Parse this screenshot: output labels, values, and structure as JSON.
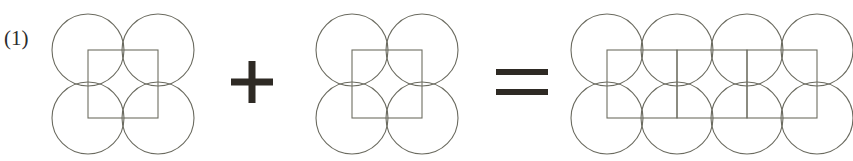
{
  "figure": {
    "label": "(1)",
    "label_position": {
      "x": 4,
      "y": 45
    },
    "colors": {
      "background": "#ffffff",
      "circle_stroke": "#6b6b60",
      "square_stroke": "#6e6e62",
      "operator": "#2e2a24",
      "label_text": "#2b2b2b"
    },
    "stroke_widths": {
      "circle": 1.1,
      "square": 1.1
    },
    "circle_radius": 36,
    "terms": [
      {
        "name": "left-term",
        "kind": "circle-square-tile",
        "circle_centers": [
          {
            "cx": 88,
            "cy": 50
          },
          {
            "cx": 158,
            "cy": 50
          },
          {
            "cx": 88,
            "cy": 118
          },
          {
            "cx": 158,
            "cy": 118
          }
        ],
        "rects": [
          {
            "x": 88,
            "y": 50,
            "w": 70,
            "h": 68
          }
        ],
        "circle_count": 4,
        "square_count": 1
      },
      {
        "name": "middle-term",
        "kind": "circle-square-tile",
        "circle_centers": [
          {
            "cx": 352,
            "cy": 50
          },
          {
            "cx": 422,
            "cy": 50
          },
          {
            "cx": 352,
            "cy": 118
          },
          {
            "cx": 422,
            "cy": 118
          }
        ],
        "rects": [
          {
            "x": 352,
            "y": 50,
            "w": 70,
            "h": 68
          }
        ],
        "circle_count": 4,
        "square_count": 1
      },
      {
        "name": "result-term",
        "kind": "circle-square-tile",
        "circle_centers": [
          {
            "cx": 607,
            "cy": 50
          },
          {
            "cx": 677,
            "cy": 50
          },
          {
            "cx": 747,
            "cy": 50
          },
          {
            "cx": 817,
            "cy": 50
          },
          {
            "cx": 607,
            "cy": 118
          },
          {
            "cx": 677,
            "cy": 118
          },
          {
            "cx": 747,
            "cy": 118
          },
          {
            "cx": 817,
            "cy": 118
          }
        ],
        "rects": [
          {
            "x": 607,
            "y": 50,
            "w": 70,
            "h": 68
          },
          {
            "x": 677,
            "y": 50,
            "w": 70,
            "h": 68
          },
          {
            "x": 747,
            "y": 50,
            "w": 70,
            "h": 68
          }
        ],
        "circle_count": 8,
        "square_count": 3
      }
    ],
    "operators": [
      {
        "name": "plus-operator",
        "glyph": "+",
        "cx": 252,
        "cy": 82,
        "arm": 21,
        "thickness": 7
      },
      {
        "name": "equals-operator",
        "glyph": "=",
        "cx": 522,
        "cy": 82,
        "half_width": 26,
        "thickness": 6,
        "gap": 14
      }
    ]
  }
}
